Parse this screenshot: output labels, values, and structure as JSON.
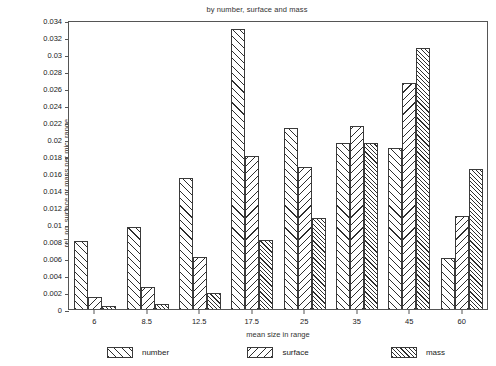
{
  "chart_data": {
    "type": "bar",
    "title": "by number, surface and mass",
    "xlabel": "mean size in range",
    "ylabel": "rel. no, surface or mass per mic. range",
    "categories": [
      "6",
      "8.5",
      "12.5",
      "17.5",
      "25",
      "35",
      "45",
      "60"
    ],
    "series": [
      {
        "name": "number",
        "hatch": "forward-diagonal",
        "values": [
          0.008,
          0.0097,
          0.0154,
          0.0329,
          0.0213,
          0.0195,
          0.019,
          0.006
        ]
      },
      {
        "name": "surface",
        "hatch": "backward-diagonal",
        "values": [
          0.0014,
          0.0026,
          0.0061,
          0.018,
          0.0167,
          0.0215,
          0.0266,
          0.011
        ]
      },
      {
        "name": "mass",
        "hatch": "dense-forward-diagonal",
        "values": [
          0.0003,
          0.0006,
          0.0019,
          0.0081,
          0.0107,
          0.0195,
          0.0307,
          0.0165
        ]
      }
    ],
    "ylim": [
      0,
      0.034
    ],
    "ytick_step": 0.002,
    "yticks": [
      "0.034",
      "0.032",
      "0.03",
      "0.028",
      "0.026",
      "0.024",
      "0.022",
      "0.02",
      "0.018",
      "0.016",
      "0.014",
      "0.012",
      "0.01",
      "0.008",
      "0.006",
      "0.004",
      "0.002",
      "0"
    ],
    "grid": false,
    "legend_position": "bottom",
    "frame_color": "#555555",
    "bar_edge_color": "#3a3a3a",
    "hatch_color": "#2e2e2e",
    "background": "#ffffff"
  }
}
